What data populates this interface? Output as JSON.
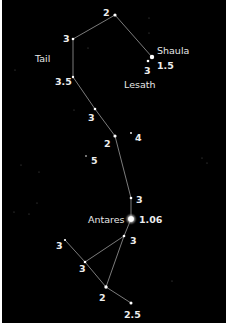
{
  "diagram": {
    "background_color": "#000000",
    "line_color": "#cfcfcf",
    "star_color": "#ffffff",
    "label_color": "#ededed",
    "name_labels": [
      {
        "id": "tail",
        "text": "Tail",
        "x": 33,
        "y": 62
      },
      {
        "id": "shaula",
        "text": "Shaula",
        "x": 155,
        "y": 54
      },
      {
        "id": "lesath",
        "text": "Lesath",
        "x": 122,
        "y": 88
      },
      {
        "id": "antares",
        "text": "Antares",
        "x": 86,
        "y": 223
      }
    ],
    "stars": [
      {
        "id": "s1",
        "name": "",
        "x": 113,
        "y": 15,
        "r": 1.6,
        "magnitude": "2",
        "lx": 101,
        "ly": 16
      },
      {
        "id": "s2",
        "name": "",
        "x": 71,
        "y": 39,
        "r": 1.3,
        "magnitude": "3",
        "lx": 61,
        "ly": 42
      },
      {
        "id": "s3",
        "name": "Shaula",
        "x": 150,
        "y": 57,
        "r": 2.2,
        "magnitude": "1.5",
        "lx": 155,
        "ly": 69
      },
      {
        "id": "s4",
        "name": "Lesath",
        "x": 146,
        "y": 61,
        "r": 1.3,
        "magnitude": "3",
        "lx": 142,
        "ly": 74
      },
      {
        "id": "s5",
        "name": "",
        "x": 71,
        "y": 77,
        "r": 1.2,
        "magnitude": "3.5",
        "lx": 53,
        "ly": 85
      },
      {
        "id": "s6",
        "name": "",
        "x": 93,
        "y": 109,
        "r": 1.3,
        "magnitude": "3",
        "lx": 86,
        "ly": 121
      },
      {
        "id": "s7",
        "name": "",
        "x": 113,
        "y": 136,
        "r": 1.6,
        "magnitude": "2",
        "lx": 102,
        "ly": 147
      },
      {
        "id": "s8",
        "name": "",
        "x": 129,
        "y": 133,
        "r": 0.9,
        "magnitude": "4",
        "lx": 133,
        "ly": 141
      },
      {
        "id": "s9",
        "name": "",
        "x": 84,
        "y": 156,
        "r": 0.8,
        "magnitude": "5",
        "lx": 89,
        "ly": 164
      },
      {
        "id": "s10",
        "name": "",
        "x": 129,
        "y": 198,
        "r": 1.3,
        "magnitude": "3",
        "lx": 134,
        "ly": 203
      },
      {
        "id": "s11",
        "name": "Antares",
        "x": 129,
        "y": 219,
        "r": 2.8,
        "magnitude": "1.06",
        "lx": 137,
        "ly": 223
      },
      {
        "id": "s12",
        "name": "",
        "x": 122,
        "y": 236,
        "r": 1.3,
        "magnitude": "3",
        "lx": 128,
        "ly": 244
      },
      {
        "id": "s13",
        "name": "",
        "x": 63,
        "y": 240,
        "r": 1.1,
        "magnitude": "3",
        "lx": 54,
        "ly": 249
      },
      {
        "id": "s14",
        "name": "",
        "x": 83,
        "y": 262,
        "r": 1.3,
        "magnitude": "3",
        "lx": 77,
        "ly": 272
      },
      {
        "id": "s15",
        "name": "",
        "x": 104,
        "y": 287,
        "r": 1.7,
        "magnitude": "2",
        "lx": 97,
        "ly": 301
      },
      {
        "id": "s16",
        "name": "",
        "x": 129,
        "y": 303,
        "r": 1.5,
        "magnitude": "2.5",
        "lx": 122,
        "ly": 318
      }
    ],
    "lines": [
      [
        "s2",
        "s1"
      ],
      [
        "s1",
        "s3"
      ],
      [
        "s2",
        "s5"
      ],
      [
        "s5",
        "s6"
      ],
      [
        "s6",
        "s7"
      ],
      [
        "s7",
        "s10"
      ],
      [
        "s10",
        "s11"
      ],
      [
        "s11",
        "s12"
      ],
      [
        "s12",
        "s14"
      ],
      [
        "s12",
        "s15"
      ],
      [
        "s13",
        "s14"
      ],
      [
        "s14",
        "s15"
      ],
      [
        "s15",
        "s16"
      ]
    ],
    "background_specks": [
      {
        "x": 147,
        "y": 18
      },
      {
        "x": 147,
        "y": 33
      },
      {
        "x": 86,
        "y": 48
      },
      {
        "x": 19,
        "y": 165
      },
      {
        "x": 37,
        "y": 172
      },
      {
        "x": 35,
        "y": 203
      },
      {
        "x": 27,
        "y": 214
      },
      {
        "x": 12,
        "y": 212
      },
      {
        "x": 13,
        "y": 70
      },
      {
        "x": 200,
        "y": 158
      },
      {
        "x": 205,
        "y": 163
      },
      {
        "x": 72,
        "y": 110
      },
      {
        "x": 170,
        "y": 281
      }
    ]
  }
}
